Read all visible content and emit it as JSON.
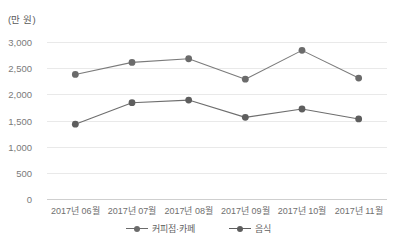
{
  "chart_data": {
    "type": "line",
    "title": "",
    "unit_label": "(만 원)",
    "xlabel": "",
    "ylabel": "",
    "ylim": [
      0,
      3000
    ],
    "yticks": [
      "0",
      "500",
      "1,000",
      "1,500",
      "2,000",
      "2,500",
      "3,000"
    ],
    "ytick_values": [
      0,
      500,
      1000,
      1500,
      2000,
      2500,
      3000
    ],
    "grid": true,
    "legend_position": "bottom",
    "categories": [
      "2017년 06월",
      "2017년 07월",
      "2017년 08월",
      "2017년 09월",
      "2017년 10월",
      "2017년 11월"
    ],
    "series": [
      {
        "name": "커피점·카페",
        "color": "#7b7b7b",
        "marker_color": "#6b6b6b",
        "values": [
          2380,
          2610,
          2680,
          2290,
          2840,
          2310
        ]
      },
      {
        "name": "음식",
        "color": "#6e6e6e",
        "marker_color": "#5e5e5e",
        "values": [
          1430,
          1840,
          1890,
          1560,
          1720,
          1530
        ]
      }
    ]
  },
  "colors": {
    "gridline": "#e9e9e9",
    "axis": "#cfcfcf",
    "text": "#6f6f6f",
    "background": "#ffffff"
  }
}
